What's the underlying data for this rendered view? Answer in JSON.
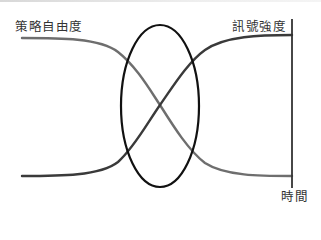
{
  "diagram": {
    "labels": {
      "strategic_freedom": "策略自由度",
      "signal_strength": "訊號強度",
      "time": "時間"
    },
    "colors": {
      "strategic_freedom_curve": "#6e6e6e",
      "signal_strength_curve": "#3a3a3a",
      "ellipse": "#111111",
      "time_axis": "#333333",
      "label_text": "#333333"
    },
    "elements": {
      "strategic_freedom_curve": "decreasing S-curve from high-left to low-right",
      "signal_strength_curve": "increasing S-curve from low-left to high-right",
      "crossover_ellipse": "highlights the intersection zone of the two curves",
      "time_axis": "vertical line at right end marking time"
    }
  }
}
